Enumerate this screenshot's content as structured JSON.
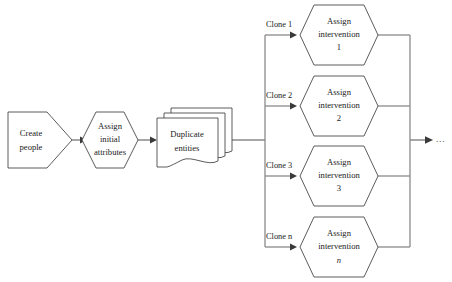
{
  "diagram": {
    "canvas": {
      "width": 452,
      "height": 282,
      "background": "#ffffff"
    },
    "colors": {
      "shape_stroke": "#4a4a4a",
      "shape_fill": "#ffffff",
      "connector": "#8a8a8a",
      "arrowhead": "#3a3a3a",
      "text": "#1a1a1a",
      "ellipsis": "#6a6a6a"
    },
    "nodes": {
      "create_people": {
        "label_line1": "Create",
        "label_line2": "people",
        "shape": "pentagon"
      },
      "assign_initial_attributes": {
        "label_line1": "Assign",
        "label_line2": "initial",
        "label_line3": "attributes",
        "shape": "hexagon"
      },
      "duplicate_entities": {
        "label_line1": "Duplicate",
        "label_line2": "entities",
        "shape": "stacked-document",
        "stack_count": 3
      }
    },
    "branches": [
      {
        "edge_label": "Clone 1",
        "label_line1": "Assign",
        "label_line2": "intervention",
        "label_line3": "1",
        "index_italic": false,
        "shape": "hexagon"
      },
      {
        "edge_label": "Clone 2",
        "label_line1": "Assign",
        "label_line2": "intervention",
        "label_line3": "2",
        "index_italic": false,
        "shape": "hexagon"
      },
      {
        "edge_label": "Clone 3",
        "label_line1": "Assign",
        "label_line2": "intervention",
        "label_line3": "3",
        "index_italic": false,
        "shape": "hexagon"
      },
      {
        "edge_label": "Clone n",
        "label_line1": "Assign",
        "label_line2": "intervention",
        "label_line3": "n",
        "index_italic": true,
        "shape": "hexagon"
      }
    ],
    "output": {
      "continuation_label": "..."
    }
  }
}
